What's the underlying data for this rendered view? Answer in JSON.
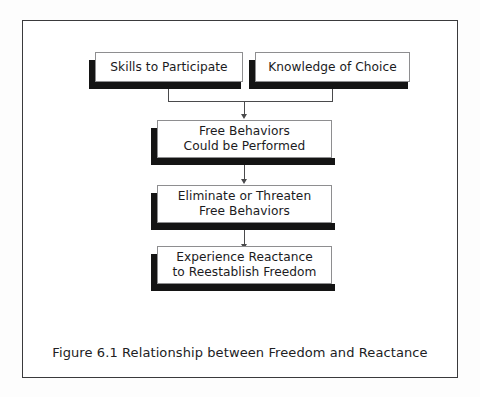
{
  "figure": {
    "caption": "Figure 6.1  Relationship between Freedom and Reactance",
    "border_color": "#3a3a3c",
    "box_border_color": "#8e8e90",
    "shadow_color": "#141414",
    "connector_color": "#4a4a4c",
    "text_color": "#1b1b1d",
    "background": "#ffffff"
  },
  "nodes": [
    {
      "id": "skills-to-participate",
      "label": "Skills to Participate",
      "level": 1,
      "column": "left"
    },
    {
      "id": "knowledge-of-choice",
      "label": "Knowledge of Choice",
      "level": 1,
      "column": "right"
    },
    {
      "id": "free-behaviors-could-be-performed",
      "label": "Free Behaviors\nCould be Performed",
      "level": 2,
      "column": "center"
    },
    {
      "id": "eliminate-or-threaten-free-behaviors",
      "label": "Eliminate or Threaten\nFree Behaviors",
      "level": 3,
      "column": "center"
    },
    {
      "id": "experience-reactance-to-reestablish-freedom",
      "label": "Experience Reactance\nto Reestablish Freedom",
      "level": 4,
      "column": "center"
    }
  ],
  "edges": [
    {
      "id": "edge-skills-to-free-behaviors",
      "from": "skills-to-participate",
      "to": "free-behaviors-could-be-performed",
      "style": "elbow-merge"
    },
    {
      "id": "edge-knowledge-to-free-behaviors",
      "from": "knowledge-of-choice",
      "to": "free-behaviors-could-be-performed",
      "style": "elbow-merge"
    },
    {
      "id": "edge-free-behaviors-to-eliminate",
      "from": "free-behaviors-could-be-performed",
      "to": "eliminate-or-threaten-free-behaviors",
      "style": "straight-arrow"
    },
    {
      "id": "edge-eliminate-to-experience-reactance",
      "from": "eliminate-or-threaten-free-behaviors",
      "to": "experience-reactance-to-reestablish-freedom",
      "style": "straight-arrow"
    }
  ]
}
